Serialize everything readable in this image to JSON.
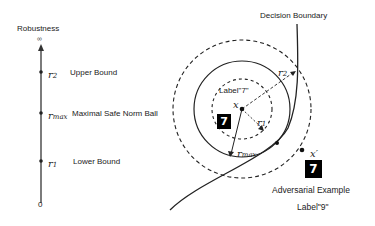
{
  "axis": {
    "title": "Robustness",
    "top_label": "∞",
    "bottom_label": "0",
    "marks": [
      {
        "symbol": "r",
        "subscript": "2",
        "label": "Upper Bound"
      },
      {
        "symbol": "r",
        "subscript": "max",
        "label": "Maximal Safe Norm Ball"
      },
      {
        "symbol": "r",
        "subscript": "1",
        "label": "Lower Bound"
      }
    ]
  },
  "diagram": {
    "boundary_label": "Decision Boundary",
    "center": {
      "symbol": "x",
      "label": "Label\"7\"",
      "digit": "7"
    },
    "radii": {
      "r2": {
        "symbol": "r",
        "subscript": "2"
      },
      "r1": {
        "symbol": "r",
        "subscript": "1"
      },
      "rmax": {
        "symbol": "r",
        "subscript": "max"
      }
    },
    "adversarial": {
      "symbol": "x′",
      "digit": "7",
      "title": "Adversarial Example",
      "label": "Label\"9\""
    }
  }
}
